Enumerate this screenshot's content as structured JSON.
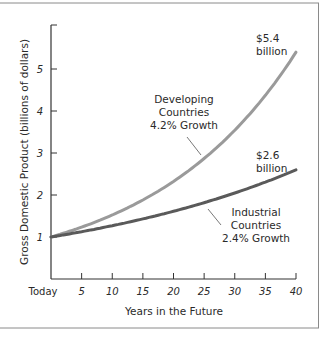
{
  "chart_data": {
    "type": "line",
    "title": "",
    "xlabel": "Years in the Future",
    "ylabel": "Gross Domestic Product (billions of dollars)",
    "x": [
      0,
      5,
      10,
      15,
      20,
      25,
      30,
      35,
      40
    ],
    "x_tick_labels": [
      "Today",
      "5",
      "10",
      "15",
      "20",
      "25",
      "30",
      "35",
      "40"
    ],
    "y_ticks": [
      1,
      2,
      3,
      4,
      5
    ],
    "xlim": [
      0,
      40
    ],
    "ylim": [
      0,
      6
    ],
    "grid": false,
    "legend": "none (inline annotations)",
    "series": [
      {
        "name": "Developing Countries",
        "growth": "4.2% Growth",
        "values": [
          1.0,
          1.23,
          1.51,
          1.85,
          2.28,
          2.8,
          3.44,
          4.23,
          5.4
        ],
        "color": "#9a9a9a",
        "end_label": "$5.4 billion"
      },
      {
        "name": "Industrial Countries",
        "growth": "2.4% Growth",
        "values": [
          1.0,
          1.13,
          1.27,
          1.43,
          1.61,
          1.81,
          2.04,
          2.3,
          2.6
        ],
        "color": "#5a5a5a",
        "end_label": "$2.6 billion"
      }
    ]
  },
  "labels": {
    "developing_line1": "Developing",
    "developing_line2": "Countries",
    "developing_line3": "4.2% Growth",
    "industrial_line1": "Industrial",
    "industrial_line2": "Countries",
    "industrial_line3": "2.4% Growth",
    "dev_end_value": "$5.4",
    "dev_end_unit": "billion",
    "ind_end_value": "$2.6",
    "ind_end_unit": "billion"
  }
}
